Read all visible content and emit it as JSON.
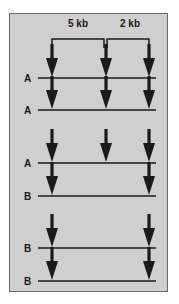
{
  "diagram": {
    "colors": {
      "background": "#cfcfcf",
      "ink": "#1a1a1a",
      "border": "#6a6a6a"
    },
    "distances": [
      {
        "label": "5 kb",
        "from_site": 0,
        "to_site": 1
      },
      {
        "label": "2 kb",
        "from_site": 1,
        "to_site": 2
      }
    ],
    "site_x": [
      52,
      106,
      149
    ],
    "rows": [
      {
        "label": "A",
        "cut_sites": [
          0,
          1,
          2
        ]
      },
      {
        "label": "A",
        "cut_sites": [
          0,
          1,
          2
        ]
      },
      {
        "label": "A",
        "cut_sites": [
          0,
          1,
          2
        ]
      },
      {
        "label": "B",
        "cut_sites": [
          0,
          2
        ]
      },
      {
        "label": "B",
        "cut_sites": [
          0,
          2
        ]
      },
      {
        "label": "B",
        "cut_sites": [
          0,
          2
        ]
      }
    ]
  }
}
